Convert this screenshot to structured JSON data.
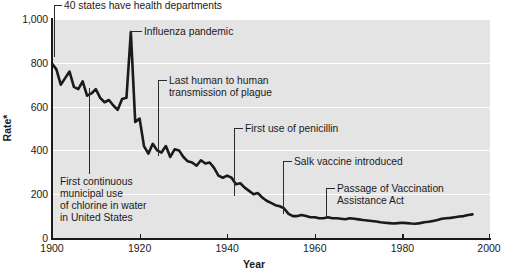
{
  "chart_data": {
    "type": "line",
    "title": "",
    "xlabel": "Year",
    "ylabel": "Rate*",
    "xlim": [
      1900,
      2000
    ],
    "ylim": [
      0,
      1000
    ],
    "grid": true,
    "legend": "none",
    "xticks": [
      "1900",
      "1920",
      "1940",
      "1960",
      "1980",
      "2000"
    ],
    "xtick_values": [
      1900,
      1920,
      1940,
      1960,
      1980,
      2000
    ],
    "yticks": [
      "0",
      "200",
      "400",
      "600",
      "800",
      "1,000"
    ],
    "ytick_values": [
      0,
      200,
      400,
      600,
      800,
      1000
    ],
    "series_name": "Crude death rate for infectious diseases",
    "x": [
      1900,
      1901,
      1902,
      1903,
      1904,
      1905,
      1906,
      1907,
      1908,
      1909,
      1910,
      1911,
      1912,
      1913,
      1914,
      1915,
      1916,
      1917,
      1918,
      1919,
      1920,
      1921,
      1922,
      1923,
      1924,
      1925,
      1926,
      1927,
      1928,
      1929,
      1930,
      1931,
      1932,
      1933,
      1934,
      1935,
      1936,
      1937,
      1938,
      1939,
      1940,
      1941,
      1942,
      1943,
      1944,
      1945,
      1946,
      1947,
      1948,
      1949,
      1950,
      1951,
      1952,
      1953,
      1954,
      1955,
      1956,
      1957,
      1958,
      1959,
      1960,
      1961,
      1962,
      1963,
      1964,
      1965,
      1966,
      1967,
      1968,
      1969,
      1970,
      1971,
      1972,
      1973,
      1974,
      1975,
      1976,
      1977,
      1978,
      1979,
      1980,
      1981,
      1982,
      1983,
      1984,
      1985,
      1986,
      1987,
      1988,
      1989,
      1990,
      1991,
      1992,
      1993,
      1994,
      1995,
      1996
    ],
    "y": [
      797,
      770,
      700,
      730,
      760,
      690,
      680,
      715,
      650,
      660,
      680,
      640,
      620,
      630,
      605,
      585,
      635,
      640,
      940,
      530,
      545,
      420,
      385,
      430,
      400,
      390,
      420,
      370,
      405,
      400,
      370,
      350,
      345,
      330,
      355,
      340,
      345,
      320,
      285,
      275,
      285,
      275,
      245,
      250,
      230,
      215,
      200,
      205,
      185,
      170,
      160,
      150,
      145,
      135,
      110,
      100,
      100,
      105,
      100,
      95,
      95,
      90,
      90,
      95,
      90,
      90,
      88,
      86,
      90,
      88,
      85,
      82,
      80,
      78,
      75,
      72,
      70,
      68,
      66,
      68,
      70,
      68,
      66,
      65,
      68,
      72,
      74,
      78,
      82,
      88,
      90,
      92,
      95,
      98,
      100,
      105,
      108
    ],
    "annotations": [
      {
        "label": "40 states have health departments",
        "year": 1900,
        "rate": 1000
      },
      {
        "label": "Influenza pandemic",
        "year": 1918,
        "rate": 940
      },
      {
        "label": "Last human to human\ntransmission of plague",
        "year": 1924,
        "rate": 400
      },
      {
        "label": "First use of penicillin",
        "year": 1942,
        "rate": 245
      },
      {
        "label": "Salk vaccine introduced",
        "year": 1955,
        "rate": 100
      },
      {
        "label": "Passage of Vaccination\nAssistance Act",
        "year": 1963,
        "rate": 95
      },
      {
        "label": "First continuous\nmunicipal use\nof chlorine in water\nin United States",
        "year": 1908,
        "rate": 650
      }
    ]
  },
  "axis": {
    "ylabel": "Rate*",
    "xlabel": "Year"
  },
  "annotations": {
    "health_departments": "40 states have health departments",
    "influenza": "Influenza pandemic",
    "plague_line1": "Last human to human",
    "plague_line2": "transmission of plague",
    "penicillin": "First use of penicillin",
    "salk": "Salk vaccine introduced",
    "vaccination_line1": "Passage of Vaccination",
    "vaccination_line2": "Assistance Act",
    "chlorine_line1": "First continuous",
    "chlorine_line2": "municipal use",
    "chlorine_line3": "of chlorine in water",
    "chlorine_line4": "in United States"
  },
  "ticks": {
    "y": [
      "1,000",
      "800",
      "600",
      "400",
      "200",
      "0"
    ],
    "x": [
      "1900",
      "1920",
      "1940",
      "1960",
      "1980",
      "2000"
    ]
  },
  "colors": {
    "plot_background": "#e4e4e4",
    "gridline": "#ffffff",
    "line": "#1a1a1a",
    "axis": "#1a1a1a",
    "page_background": "#ffffff"
  }
}
